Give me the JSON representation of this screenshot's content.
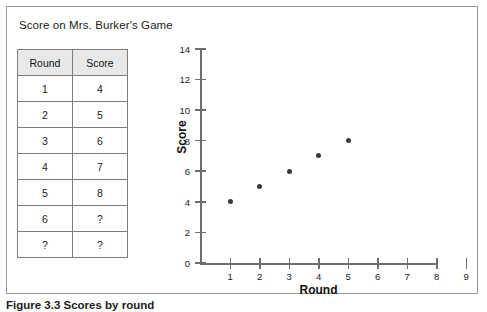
{
  "figure": {
    "title": "Score on Mrs. Burker's Game",
    "caption": "Figure 3.3 Scores by round"
  },
  "table": {
    "headers": [
      "Round",
      "Score"
    ],
    "rows": [
      [
        "1",
        "4"
      ],
      [
        "2",
        "5"
      ],
      [
        "3",
        "6"
      ],
      [
        "4",
        "7"
      ],
      [
        "5",
        "8"
      ],
      [
        "6",
        "?"
      ],
      [
        "?",
        "?"
      ]
    ]
  },
  "chart_data": {
    "type": "scatter",
    "title": "Score on Mrs. Burker's Game",
    "xlabel": "Round",
    "ylabel": "Score",
    "x": [
      1,
      2,
      3,
      4,
      5
    ],
    "values": [
      4,
      5,
      6,
      7,
      8
    ],
    "points": [
      {
        "x": 1,
        "y": 4
      },
      {
        "x": 2,
        "y": 5
      },
      {
        "x": 3,
        "y": 6
      },
      {
        "x": 4,
        "y": 7
      },
      {
        "x": 5,
        "y": 8
      }
    ],
    "xlim": [
      0,
      9
    ],
    "ylim": [
      0,
      14
    ],
    "xticks": [
      1,
      2,
      3,
      4,
      5,
      6,
      7,
      8,
      9
    ],
    "yticks": [
      0,
      2,
      4,
      6,
      8,
      10,
      12,
      14
    ],
    "grid": false,
    "legend": null,
    "marker_color": "#3a3a3a",
    "axis_color": "#6e6e6e"
  }
}
